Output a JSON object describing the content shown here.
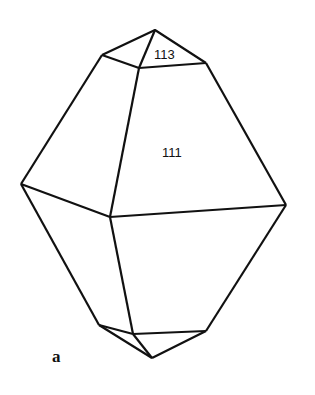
{
  "diagram": {
    "type": "crystal-habit",
    "faces": [
      {
        "label": "113",
        "x": 167,
        "y": 59
      },
      {
        "label": "111",
        "x": 175,
        "y": 157
      }
    ],
    "caption": "a",
    "edge_color": "#111111"
  }
}
